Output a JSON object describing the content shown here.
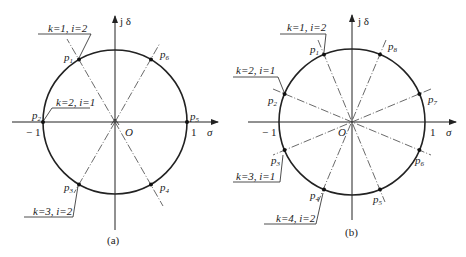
{
  "figures": [
    {
      "id": "a",
      "caption": "(a)",
      "axes": {
        "x_label": "σ",
        "y_label": "j δ",
        "origin": "O",
        "neg_one": "− 1",
        "pos_one": "1"
      },
      "poles": [
        {
          "label": "p1",
          "angle_deg": 120
        },
        {
          "label": "p2",
          "angle_deg": 180
        },
        {
          "label": "p3",
          "angle_deg": 240
        },
        {
          "label": "p4",
          "angle_deg": 300
        },
        {
          "label": "p5",
          "angle_deg": 0
        },
        {
          "label": "p6",
          "angle_deg": 60
        }
      ],
      "callouts": [
        {
          "text": "k=1, i=2",
          "pole": "p1"
        },
        {
          "text": "k=2, i=1",
          "pole": "p2"
        },
        {
          "text": "k=3, i=2",
          "pole": "p3"
        }
      ]
    },
    {
      "id": "b",
      "caption": "(b)",
      "axes": {
        "x_label": "σ",
        "y_label": "j δ",
        "origin": "O",
        "neg_one": "− 1",
        "pos_one": "1"
      },
      "poles": [
        {
          "label": "p1",
          "angle_deg": 112.5
        },
        {
          "label": "p2",
          "angle_deg": 157.5
        },
        {
          "label": "p3",
          "angle_deg": 202.5
        },
        {
          "label": "p4",
          "angle_deg": 247.5
        },
        {
          "label": "p5",
          "angle_deg": 292.5
        },
        {
          "label": "p6",
          "angle_deg": 337.5
        },
        {
          "label": "p7",
          "angle_deg": 22.5
        },
        {
          "label": "p8",
          "angle_deg": 67.5
        }
      ],
      "callouts": [
        {
          "text": "k=1, i=2",
          "pole": "p1"
        },
        {
          "text": "k=2, i=1",
          "pole": "p2"
        },
        {
          "text": "k=3, i=1",
          "pole": "p3"
        },
        {
          "text": "k=4, i=2",
          "pole": "p4"
        }
      ]
    }
  ],
  "labels": {
    "a": {
      "yaxis": "j δ",
      "xaxis": "σ",
      "origin": "O",
      "neg1": "− 1",
      "pos1": "1",
      "caption": "(a)",
      "p1": "p",
      "p1s": "1",
      "p2": "p",
      "p2s": "2",
      "p3": "p",
      "p3s": "3",
      "p4": "p",
      "p4s": "4",
      "p5": "p",
      "p5s": "5",
      "p6": "p",
      "p6s": "6",
      "c1": "k=1, i=2",
      "c2": "k=2, i=1",
      "c3": "k=3, i=2"
    },
    "b": {
      "yaxis": "j δ",
      "xaxis": "σ",
      "origin": "O",
      "neg1": "− 1",
      "pos1": "1",
      "caption": "(b)",
      "p1": "p",
      "p1s": "1",
      "p2": "p",
      "p2s": "2",
      "p3": "p",
      "p3s": "3",
      "p4": "p",
      "p4s": "4",
      "p5": "p",
      "p5s": "5",
      "p6": "p",
      "p6s": "6",
      "p7": "p",
      "p7s": "7",
      "p8": "p",
      "p8s": "8",
      "c1": "k=1, i=2",
      "c2": "k=2, i=1",
      "c3": "k=3, i=1",
      "c4": "k=4, i=2"
    }
  }
}
